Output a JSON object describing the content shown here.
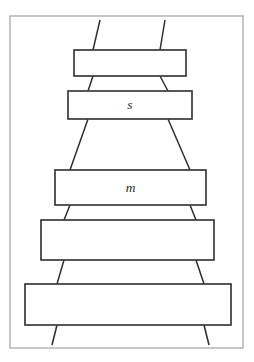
{
  "figure": {
    "caption": "",
    "frame": {
      "x": 10,
      "y": 16,
      "width": 233,
      "height": 332,
      "stroke_color": "#b9b9b9"
    },
    "style": {
      "box_stroke_color": "#3a3a3a",
      "strand_stroke_color": "#2f2f2f",
      "background_color": "#ffffff",
      "label_color": "#2b2b2b"
    },
    "boxes": [
      {
        "id": "box-1",
        "label": "",
        "x": 74,
        "y": 50,
        "width": 112,
        "height": 26
      },
      {
        "id": "box-2",
        "label": "s",
        "x": 68,
        "y": 91,
        "width": 124,
        "height": 28
      },
      {
        "id": "box-3",
        "label": "m",
        "x": 55,
        "y": 170,
        "width": 151,
        "height": 35
      },
      {
        "id": "box-4",
        "label": "",
        "x": 41,
        "y": 220,
        "width": 173,
        "height": 40
      },
      {
        "id": "box-5",
        "label": "",
        "x": 25,
        "y": 284,
        "width": 206,
        "height": 41
      }
    ],
    "strands": [
      {
        "id": "strand-top-left",
        "x1": 100,
        "y1": 20,
        "x2": 93,
        "y2": 50
      },
      {
        "id": "strand-top-right",
        "x1": 165,
        "y1": 20,
        "x2": 160,
        "y2": 50
      },
      {
        "id": "strand-1-2-left",
        "x1": 93,
        "y1": 76,
        "x2": 88,
        "y2": 91
      },
      {
        "id": "strand-1-2-right",
        "x1": 160,
        "y1": 76,
        "x2": 168,
        "y2": 91
      },
      {
        "id": "strand-2-3-left",
        "x1": 88,
        "y1": 119,
        "x2": 70,
        "y2": 170
      },
      {
        "id": "strand-2-3-right",
        "x1": 168,
        "y1": 119,
        "x2": 190,
        "y2": 170
      },
      {
        "id": "strand-3-4-left",
        "x1": 70,
        "y1": 205,
        "x2": 64,
        "y2": 220
      },
      {
        "id": "strand-3-4-right",
        "x1": 190,
        "y1": 205,
        "x2": 196,
        "y2": 220
      },
      {
        "id": "strand-4-5-left",
        "x1": 64,
        "y1": 260,
        "x2": 57,
        "y2": 284
      },
      {
        "id": "strand-4-5-right",
        "x1": 196,
        "y1": 260,
        "x2": 204,
        "y2": 284
      },
      {
        "id": "strand-bottom-left",
        "x1": 57,
        "y1": 325,
        "x2": 52,
        "y2": 345
      },
      {
        "id": "strand-bottom-right",
        "x1": 204,
        "y1": 325,
        "x2": 209,
        "y2": 345
      }
    ]
  }
}
